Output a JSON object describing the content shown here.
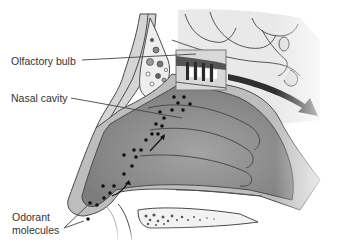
{
  "diagram": {
    "labels": {
      "olfactory_bulb": "Olfactory bulb",
      "nasal_cavity": "Nasal cavity",
      "odorant_line1": "Odorant",
      "odorant_line2": "molecules"
    },
    "icons": {
      "signal_arrow": "large-curved-arrow",
      "airflow_arrows": "small-arrows",
      "molecules": "dots"
    },
    "colors": {
      "background": "#ffffff",
      "cavity_fill": "#8a8a8a",
      "tissue_fill": "#b9b9b9",
      "bone_fill": "#e6e6e6",
      "outline": "#4a4a4a",
      "label_text": "#333333",
      "arrow_fill": "#3a3a3a"
    }
  }
}
